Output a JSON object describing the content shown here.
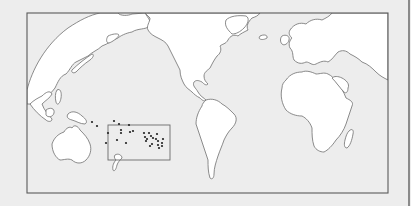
{
  "map": {
    "type": "world-outline-map",
    "projection": "pacific-centered",
    "colors": {
      "background": "#ededed",
      "ocean": "#ececec",
      "land": "#ffffff",
      "outline": "#6e6e6e",
      "frame": "#5a5a5a",
      "dots": "#222222"
    },
    "frame": {
      "x": 27,
      "y": 13,
      "width": 361,
      "height": 180
    },
    "inset_box": {
      "x": 108,
      "y": 125,
      "width": 62,
      "height": 35
    },
    "regions_shown": [
      "Asia",
      "Europe",
      "Africa",
      "North America",
      "South America",
      "Australia",
      "New Zealand",
      "Madagascar",
      "Pacific Islands"
    ],
    "dots": [
      [
        92,
        122
      ],
      [
        97,
        126
      ],
      [
        114,
        121
      ],
      [
        119,
        124
      ],
      [
        129,
        125
      ],
      [
        108,
        133
      ],
      [
        106,
        143
      ],
      [
        121,
        130
      ],
      [
        130,
        132
      ],
      [
        133,
        131
      ],
      [
        121,
        133
      ],
      [
        117,
        140
      ],
      [
        126,
        143
      ],
      [
        144,
        133
      ],
      [
        149,
        133
      ],
      [
        157,
        134
      ],
      [
        145,
        137
      ],
      [
        147,
        139
      ],
      [
        151,
        136
      ],
      [
        153,
        138
      ],
      [
        156,
        139
      ],
      [
        158,
        141
      ],
      [
        146,
        141
      ],
      [
        150,
        146
      ],
      [
        158,
        145
      ],
      [
        162,
        143
      ],
      [
        163,
        139
      ],
      [
        162,
        146
      ],
      [
        159,
        148
      ],
      [
        152,
        144
      ]
    ]
  }
}
